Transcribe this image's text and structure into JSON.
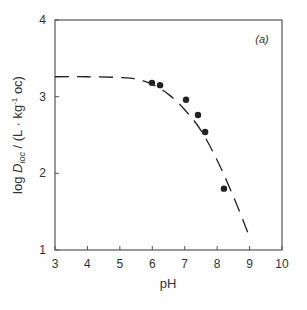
{
  "chart_data": {
    "type": "scatter",
    "title": "",
    "panel_label": "(a)",
    "xlabel": "pH",
    "ylabel": "log D_ioc / (L · kg⁻¹ oc)",
    "ylabel_parts": {
      "pre": "log ",
      "D": "D",
      "sub": "ioc",
      "post": " / (L · kg",
      "sup": "-1",
      "tail": " oc)"
    },
    "xlim": [
      3,
      10
    ],
    "ylim": [
      1,
      4
    ],
    "xticks": [
      3,
      4,
      5,
      6,
      7,
      8,
      9,
      10
    ],
    "yticks": [
      1,
      2,
      3,
      4
    ],
    "grid": false,
    "legend": null,
    "series": [
      {
        "name": "measured",
        "style": "points",
        "x": [
          5.99,
          6.24,
          7.04,
          7.41,
          7.63,
          8.21
        ],
        "y": [
          3.18,
          3.15,
          2.96,
          2.76,
          2.54,
          1.8
        ]
      },
      {
        "name": "model",
        "style": "dashed-line",
        "x": [
          3.0,
          4.0,
          5.0,
          5.5,
          6.0,
          6.5,
          7.0,
          7.5,
          8.0,
          8.5,
          9.0
        ],
        "y": [
          3.26,
          3.26,
          3.25,
          3.23,
          3.16,
          3.03,
          2.83,
          2.56,
          2.17,
          1.7,
          1.17
        ]
      }
    ]
  },
  "colors": {
    "axis": "#555555",
    "ink": "#222222",
    "background": "#fefefe"
  }
}
